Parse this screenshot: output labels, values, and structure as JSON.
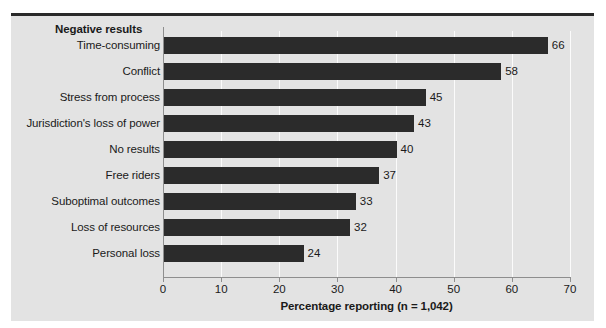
{
  "chart_data": {
    "type": "bar",
    "orientation": "horizontal",
    "title": "Negative results",
    "xlabel": "Percentage reporting (n = 1,042)",
    "ylabel": "",
    "xlim": [
      0,
      70
    ],
    "xticks": [
      0,
      10,
      20,
      30,
      40,
      50,
      60,
      70
    ],
    "xtick_labels": [
      "0",
      "10",
      "20",
      "30",
      "40",
      "50",
      "60",
      "70"
    ],
    "grid": "vertical-white-gridlines",
    "legend": "none",
    "bar_color": "#2b2b2b",
    "background_color": "#e3e3e3",
    "categories": [
      "Time-consuming",
      "Conflict",
      "Stress from process",
      "Jurisdiction's loss of power",
      "No results",
      "Free riders",
      "Suboptimal outcomes",
      "Loss of resources",
      "Personal loss"
    ],
    "values": [
      66,
      58,
      45,
      43,
      40,
      37,
      33,
      32,
      24
    ],
    "value_labels": [
      "66",
      "58",
      "45",
      "43",
      "40",
      "37",
      "33",
      "32",
      "24"
    ]
  }
}
